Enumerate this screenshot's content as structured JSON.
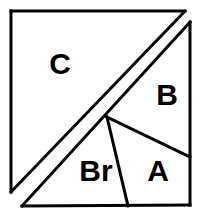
{
  "figure": {
    "canvas": {
      "width": 205,
      "height": 221
    },
    "stroke_color": "#000000",
    "fill_color": "#ffffff",
    "stroke_width": 3,
    "labels": [
      {
        "id": "C",
        "text": "C",
        "x": 60,
        "y": 66,
        "font_size": 30
      },
      {
        "id": "B",
        "text": "B",
        "x": 167,
        "y": 97,
        "font_size": 30
      },
      {
        "id": "Br",
        "text": "Br",
        "x": 96,
        "y": 173,
        "font_size": 30
      },
      {
        "id": "A",
        "text": "A",
        "x": 158,
        "y": 173,
        "font_size": 30
      }
    ],
    "vertices": {
      "outer_top_left": [
        11,
        11
      ],
      "outer_top_right": [
        185,
        11
      ],
      "outer_bottom_left": [
        11,
        192
      ],
      "inner_top_right": [
        190,
        22
      ],
      "inner_bottom_right": [
        190,
        205
      ],
      "inner_bottom_left": [
        22,
        206
      ],
      "center_vertex": [
        107,
        117
      ],
      "right_edge_split": [
        190,
        157
      ],
      "bottom_edge_split": [
        128,
        206
      ]
    },
    "segments": [
      {
        "id": "outer-top-edge",
        "points": "11,11 185,11"
      },
      {
        "id": "outer-left-edge",
        "points": "11,11 11,192"
      },
      {
        "id": "outer-hypotenuse",
        "points": "11,192 185,11"
      },
      {
        "id": "inner-right-edge",
        "points": "190,22 190,205"
      },
      {
        "id": "inner-bottom-edge",
        "points": "22,206 190,205"
      },
      {
        "id": "inner-hypotenuse",
        "points": "22,206 190,22"
      },
      {
        "id": "b-a-divider",
        "points": "107,117 190,157"
      },
      {
        "id": "br-a-divider",
        "points": "107,117 128,206"
      }
    ]
  }
}
